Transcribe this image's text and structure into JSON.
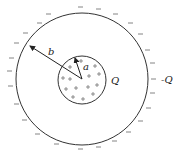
{
  "diagram": {
    "type": "concentric-spheres-charge",
    "outer_shell": {
      "radius_label": "b",
      "charge_label": "-Q",
      "charge_sign": "−"
    },
    "inner_sphere": {
      "radius_label": "a",
      "charge_label": "Q",
      "charge_sign": "+"
    },
    "colors": {
      "stroke": "#333333",
      "background": "#ffffff",
      "text": "#222222"
    }
  }
}
